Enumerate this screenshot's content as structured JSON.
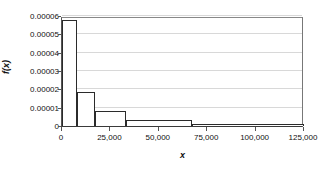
{
  "chart_data": {
    "type": "bar",
    "title": "",
    "subtitle": "",
    "xlabel": "x",
    "ylabel": "f(x)",
    "xlim": [
      0,
      125000
    ],
    "ylim": [
      0,
      6e-05
    ],
    "grid": true,
    "legend": null,
    "x_ticks": [
      {
        "value": 0,
        "label": "0"
      },
      {
        "value": 25000,
        "label": "25,000"
      },
      {
        "value": 50000,
        "label": "50,000"
      },
      {
        "value": 75000,
        "label": "75,000"
      },
      {
        "value": 100000,
        "label": "100,000"
      },
      {
        "value": 125000,
        "label": "125,000"
      }
    ],
    "y_ticks": [
      {
        "value": 0,
        "label": "0"
      },
      {
        "value": 1e-05,
        "label": "0.00001"
      },
      {
        "value": 2e-05,
        "label": "0.00002"
      },
      {
        "value": 3e-05,
        "label": "0.00003"
      },
      {
        "value": 4e-05,
        "label": "0.00004"
      },
      {
        "value": 5e-05,
        "label": "0.00005"
      },
      {
        "value": 6e-05,
        "label": "0.00006"
      }
    ],
    "bars": [
      {
        "x_start": 0,
        "x_end": 8000,
        "value": 5.8e-05
      },
      {
        "x_start": 8000,
        "x_end": 17000,
        "value": 1.85e-05
      },
      {
        "x_start": 17000,
        "x_end": 33000,
        "value": 8e-06
      },
      {
        "x_start": 33000,
        "x_end": 67000,
        "value": 3.3e-06
      },
      {
        "x_start": 67000,
        "x_end": 125000,
        "value": 1e-06
      }
    ],
    "colors": {
      "bar_outline": "#2b2b2b",
      "bar_fill": "#ffffff",
      "gridline": "#d8d8d8",
      "axis": "#3a3a3a",
      "text": "#111111",
      "background": "#ffffff"
    }
  }
}
